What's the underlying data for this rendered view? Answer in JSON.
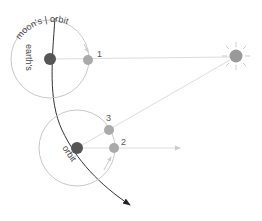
{
  "diagram": {
    "labels": {
      "orbit_top": "moon's | orbit",
      "earths": "earth's",
      "orbit_bottom": "orbit"
    },
    "positions": [
      {
        "id": "1",
        "label": "1"
      },
      {
        "id": "2",
        "label": "2"
      },
      {
        "id": "3",
        "label": "3"
      }
    ],
    "colors": {
      "earth": "#555555",
      "moon": "#aaaaaa",
      "sun": "#999999",
      "orbit": "#c8c8c8",
      "ray": "#dddddd",
      "path": "#333333"
    }
  }
}
